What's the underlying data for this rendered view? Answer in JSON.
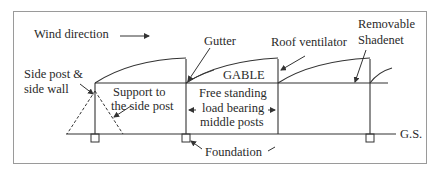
{
  "diagram": {
    "type": "greenhouse-structure-cross-section",
    "labels": {
      "wind_direction": "Wind direction",
      "gutter": "Gutter",
      "roof_ventilator": "Roof ventilator",
      "removable_shadenet_line1": "Removable",
      "removable_shadenet_line2": "Shadenet",
      "side_post_line1": "Side post &",
      "side_post_line2": "side wall",
      "support_line1": "Support to",
      "support_line2": "the side post",
      "gable": "GABLE",
      "free_standing_line1": "Free standing",
      "free_standing_line2": "load bearing",
      "free_standing_line3": "middle posts",
      "ground_surface": "G.S.",
      "foundation": "Foundation"
    },
    "colors": {
      "line": "#333333",
      "border": "#9a9a9a",
      "background": "#ffffff"
    }
  }
}
